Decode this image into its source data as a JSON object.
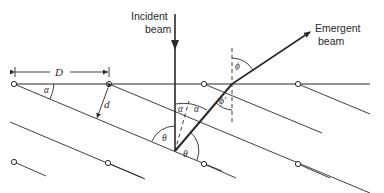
{
  "diagram": {
    "type": "x-ray diffraction geometry (crystal planes inclined to surface)",
    "labels": {
      "incident_line1": "Incident",
      "incident_line2": "beam",
      "emergent_line1": "Emergent",
      "emergent_line2": "beam",
      "spacing_D": "D",
      "spacing_d": "d",
      "angle_alpha": "α",
      "angle_theta": "θ",
      "angle_phi": "ϕ",
      "angle_phi_prime": "ϕ'"
    },
    "colors": {
      "line": "#2a2a2a",
      "background": "#ffffff"
    }
  }
}
